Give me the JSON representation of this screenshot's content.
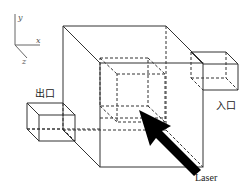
{
  "diagram": {
    "type": "3d-schematic",
    "axes": {
      "y": "y",
      "x": "x",
      "z": "z"
    },
    "labels": {
      "exit": "出口",
      "entrance": "入口",
      "laser": "Laser"
    },
    "colors": {
      "line": "#333333",
      "arrow": "#000000",
      "axis": "#666666"
    }
  }
}
